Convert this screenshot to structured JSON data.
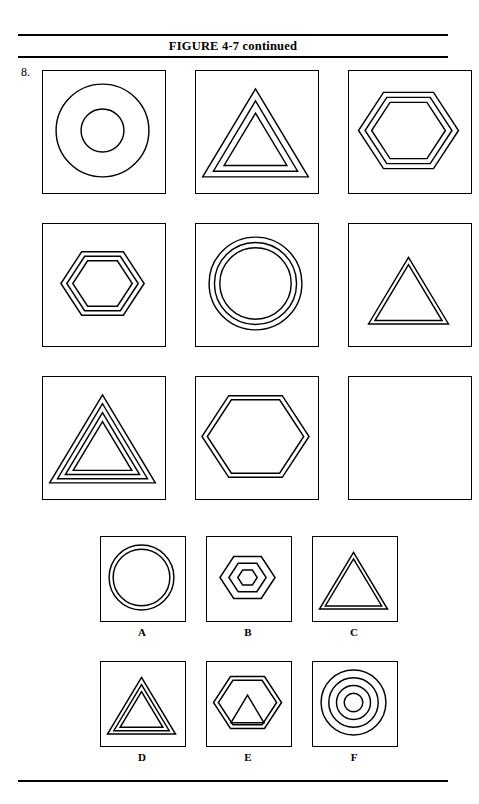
{
  "document": {
    "figure_title": "FIGURE 4-7 continued",
    "item_number": "8.",
    "page_width": 479,
    "page_height": 804,
    "ink_color": "#000000",
    "paper_color": "#ffffff"
  },
  "rules": {
    "top": "horizontal-rule",
    "under_title": "horizontal-rule",
    "bottom": "horizontal-rule"
  },
  "matrix": {
    "rows": 3,
    "cols": 3,
    "box_size": 122,
    "gap_x": 31,
    "gap_y": 31,
    "cells": [
      {
        "position": "r1c1",
        "shape": "circle",
        "count": 2,
        "note": "two concentric circles, wide spacing",
        "empty": false
      },
      {
        "position": "r1c2",
        "shape": "triangle",
        "count": 3,
        "note": "three nested triangles",
        "empty": false
      },
      {
        "position": "r1c3",
        "shape": "hexagon",
        "count": 3,
        "note": "three nested hexagons, large",
        "empty": false
      },
      {
        "position": "r2c1",
        "shape": "hexagon",
        "count": 3,
        "note": "three nested hexagons, medium",
        "empty": false
      },
      {
        "position": "r2c2",
        "shape": "circle",
        "count": 3,
        "note": "three concentric circles, large",
        "empty": false
      },
      {
        "position": "r2c3",
        "shape": "triangle",
        "count": 2,
        "note": "two nested triangles, medium",
        "empty": false
      },
      {
        "position": "r3c1",
        "shape": "triangle",
        "count": 4,
        "note": "four nested triangles",
        "empty": false
      },
      {
        "position": "r3c2",
        "shape": "hexagon",
        "count": 2,
        "note": "two nested hexagons, large",
        "empty": false
      },
      {
        "position": "r3c3",
        "shape": "none",
        "count": 0,
        "note": "blank answer cell",
        "empty": true
      }
    ]
  },
  "options": {
    "box_size": 84,
    "items": [
      {
        "label": "A",
        "shape": "circle",
        "count": 2,
        "note": "two concentric circles, tight spacing"
      },
      {
        "label": "B",
        "shape": "hexagon",
        "count": 3,
        "note": "three nested hexagons, small"
      },
      {
        "label": "C",
        "shape": "triangle",
        "count": 2,
        "note": "two nested triangles"
      },
      {
        "label": "D",
        "shape": "triangle",
        "count": 3,
        "note": "three nested triangles"
      },
      {
        "label": "E",
        "shape": "hexagon-with-triangle",
        "count": 3,
        "note": "two nested hexagons enclosing a triangle"
      },
      {
        "label": "F",
        "shape": "circle",
        "count": 4,
        "note": "four concentric circles"
      }
    ]
  }
}
